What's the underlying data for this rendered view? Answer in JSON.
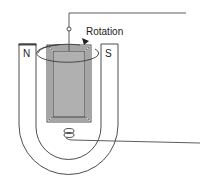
{
  "diagram": {
    "title": "",
    "labels": {
      "rotation": "Rotation",
      "north_pole": "N",
      "south_pole": "S"
    },
    "colors": {
      "line": "#3a3a3a",
      "coil_fill": "#b0b0b0",
      "background": "#ffffff"
    },
    "components": [
      "permanent-magnet-north",
      "permanent-magnet-south",
      "u-shaped-magnet",
      "rotating-coil",
      "rotation-ellipse-arrow",
      "terminal-top",
      "spiral-spring-bottom",
      "lead-wire-top",
      "lead-wire-bottom"
    ]
  }
}
